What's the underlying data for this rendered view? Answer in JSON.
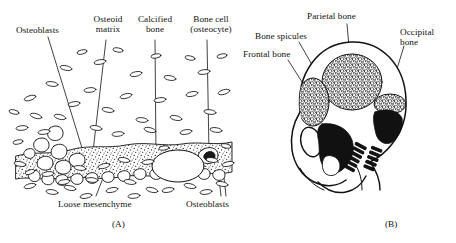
{
  "figure": {
    "background": "#ffffff",
    "ink": "#111111",
    "panels": [
      {
        "id": "A",
        "caption": "(A)",
        "subject": "intramembranous ossification histology"
      },
      {
        "id": "B",
        "caption": "(B)",
        "subject": "fetal skull lateral view"
      }
    ]
  },
  "panel_a": {
    "caption": "(A)",
    "labels": [
      {
        "key": "osteoblasts_top",
        "text": "Osteoblasts"
      },
      {
        "key": "osteoid_matrix",
        "line1": "Osteoid",
        "line2": "matrix"
      },
      {
        "key": "calcified_bone",
        "line1": "Calcified",
        "line2": "bone"
      },
      {
        "key": "bone_cell",
        "line1": "Bone cell",
        "line2": "(osteocyte)"
      },
      {
        "key": "loose_mesenchyme",
        "text": "Loose mesenchyme"
      },
      {
        "key": "osteoblasts_bottom",
        "text": "Osteoblasts"
      }
    ]
  },
  "panel_b": {
    "caption": "(B)",
    "labels": [
      {
        "key": "parietal_bone",
        "text": "Parietal bone"
      },
      {
        "key": "bone_spicules",
        "text": "Bone spicules"
      },
      {
        "key": "frontal_bone",
        "text": "Frontal bone"
      },
      {
        "key": "occipital_bone",
        "line1": "Occipital",
        "line2": "bone"
      }
    ]
  }
}
